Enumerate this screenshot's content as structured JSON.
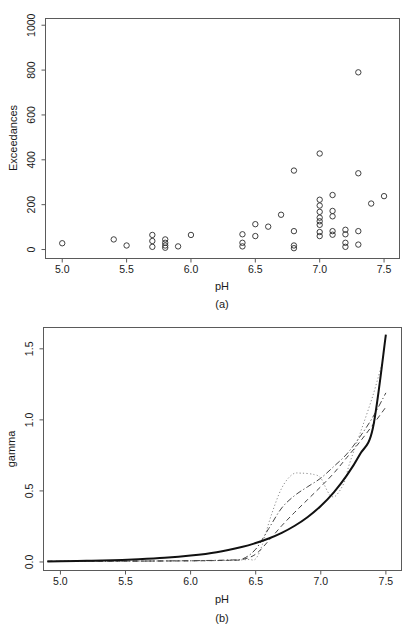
{
  "figure": {
    "background": "#ffffff",
    "panel_a_label": "(a)",
    "panel_b_label": "(b)"
  },
  "chart_data": [
    {
      "type": "scatter",
      "panel": "(a)",
      "title": "",
      "xlabel": "pH",
      "ylabel": "Exceedances",
      "xlim": [
        4.87,
        7.62
      ],
      "ylim": [
        -40,
        1030
      ],
      "xticks": [
        5.0,
        5.5,
        6.0,
        6.5,
        7.0,
        7.5
      ],
      "xticklabels": [
        "5.0",
        "5.5",
        "6.0",
        "6.5",
        "7.0",
        "7.5"
      ],
      "yticks": [
        0,
        200,
        400,
        600,
        800,
        1000
      ],
      "yticklabels": [
        "0",
        "200",
        "400",
        "600",
        "800",
        "1000"
      ],
      "grid": false,
      "marker": "open-circle",
      "points": [
        {
          "x": 5.0,
          "y": 28
        },
        {
          "x": 5.4,
          "y": 45
        },
        {
          "x": 5.5,
          "y": 18
        },
        {
          "x": 5.7,
          "y": 65
        },
        {
          "x": 5.7,
          "y": 38
        },
        {
          "x": 5.7,
          "y": 12
        },
        {
          "x": 5.8,
          "y": 45
        },
        {
          "x": 5.8,
          "y": 30
        },
        {
          "x": 5.8,
          "y": 18
        },
        {
          "x": 5.8,
          "y": 8
        },
        {
          "x": 5.9,
          "y": 14
        },
        {
          "x": 6.0,
          "y": 65
        },
        {
          "x": 6.4,
          "y": 68
        },
        {
          "x": 6.4,
          "y": 30
        },
        {
          "x": 6.4,
          "y": 14
        },
        {
          "x": 6.5,
          "y": 113
        },
        {
          "x": 6.5,
          "y": 60
        },
        {
          "x": 6.6,
          "y": 102
        },
        {
          "x": 6.7,
          "y": 155
        },
        {
          "x": 6.8,
          "y": 352
        },
        {
          "x": 6.8,
          "y": 82
        },
        {
          "x": 6.8,
          "y": 18
        },
        {
          "x": 6.8,
          "y": 6
        },
        {
          "x": 7.0,
          "y": 428
        },
        {
          "x": 7.0,
          "y": 222
        },
        {
          "x": 7.0,
          "y": 196
        },
        {
          "x": 7.0,
          "y": 168
        },
        {
          "x": 7.0,
          "y": 142
        },
        {
          "x": 7.0,
          "y": 126
        },
        {
          "x": 7.0,
          "y": 110
        },
        {
          "x": 7.0,
          "y": 78
        },
        {
          "x": 7.0,
          "y": 60
        },
        {
          "x": 7.1,
          "y": 243
        },
        {
          "x": 7.1,
          "y": 172
        },
        {
          "x": 7.1,
          "y": 148
        },
        {
          "x": 7.1,
          "y": 82
        },
        {
          "x": 7.1,
          "y": 66
        },
        {
          "x": 7.2,
          "y": 88
        },
        {
          "x": 7.2,
          "y": 68
        },
        {
          "x": 7.2,
          "y": 30
        },
        {
          "x": 7.2,
          "y": 12
        },
        {
          "x": 7.3,
          "y": 790
        },
        {
          "x": 7.3,
          "y": 340
        },
        {
          "x": 7.3,
          "y": 82
        },
        {
          "x": 7.3,
          "y": 22
        },
        {
          "x": 7.4,
          "y": 205
        },
        {
          "x": 7.5,
          "y": 238
        }
      ]
    },
    {
      "type": "line",
      "panel": "(b)",
      "title": "",
      "xlabel": "pH",
      "ylabel": "gamma",
      "xlim": [
        4.87,
        7.62
      ],
      "ylim": [
        -0.06,
        1.65
      ],
      "xticks": [
        5.0,
        5.5,
        6.0,
        6.5,
        7.0,
        7.5
      ],
      "xticklabels": [
        "5.0",
        "5.5",
        "6.0",
        "6.5",
        "7.0",
        "7.5"
      ],
      "yticks": [
        0.0,
        0.5,
        1.0,
        1.5
      ],
      "yticklabels": [
        "0.0",
        "0.5",
        "1.0",
        "1.5"
      ],
      "grid": false,
      "legend": "none",
      "series": [
        {
          "name": "solid",
          "style": "solid",
          "color": "#111111",
          "x": [
            4.9,
            5.0,
            5.2,
            5.4,
            5.6,
            5.8,
            6.0,
            6.2,
            6.4,
            6.5,
            6.6,
            6.7,
            6.8,
            6.9,
            7.0,
            7.1,
            7.2,
            7.3,
            7.4,
            7.5
          ],
          "y": [
            0.004,
            0.005,
            0.008,
            0.012,
            0.019,
            0.029,
            0.045,
            0.069,
            0.107,
            0.133,
            0.165,
            0.205,
            0.255,
            0.317,
            0.394,
            0.49,
            0.609,
            0.757,
            0.941,
            1.6
          ]
        },
        {
          "name": "dashed",
          "style": "dashed",
          "color": "#444444",
          "x": [
            4.9,
            5.5,
            6.0,
            6.3,
            6.4,
            6.5,
            6.6,
            6.7,
            6.8,
            6.9,
            7.0,
            7.1,
            7.2,
            7.3,
            7.4,
            7.5
          ],
          "y": [
            0.005,
            0.006,
            0.008,
            0.012,
            0.018,
            0.055,
            0.15,
            0.255,
            0.35,
            0.44,
            0.53,
            0.625,
            0.735,
            0.845,
            0.965,
            1.09
          ]
        },
        {
          "name": "dash-dot",
          "style": "dashdot",
          "color": "#444444",
          "x": [
            4.9,
            5.5,
            6.0,
            6.3,
            6.4,
            6.5,
            6.6,
            6.7,
            6.8,
            6.9,
            7.0,
            7.1,
            7.2,
            7.3,
            7.4,
            7.5
          ],
          "y": [
            0.005,
            0.006,
            0.009,
            0.014,
            0.022,
            0.09,
            0.235,
            0.38,
            0.468,
            0.53,
            0.59,
            0.672,
            0.76,
            0.88,
            1.02,
            1.19
          ]
        },
        {
          "name": "dotted",
          "style": "dotted",
          "color": "#8e8e8e",
          "x": [
            4.9,
            5.5,
            6.0,
            6.3,
            6.4,
            6.45,
            6.5,
            6.55,
            6.62,
            6.7,
            6.78,
            6.85,
            6.95,
            7.0,
            7.05,
            7.08,
            7.12,
            7.18,
            7.22,
            7.3,
            7.4,
            7.48
          ],
          "y": [
            0.005,
            0.006,
            0.008,
            0.011,
            0.015,
            0.018,
            0.022,
            0.12,
            0.33,
            0.52,
            0.615,
            0.625,
            0.615,
            0.59,
            0.5,
            0.462,
            0.47,
            0.56,
            0.69,
            0.9,
            1.17,
            1.43
          ]
        }
      ]
    }
  ]
}
